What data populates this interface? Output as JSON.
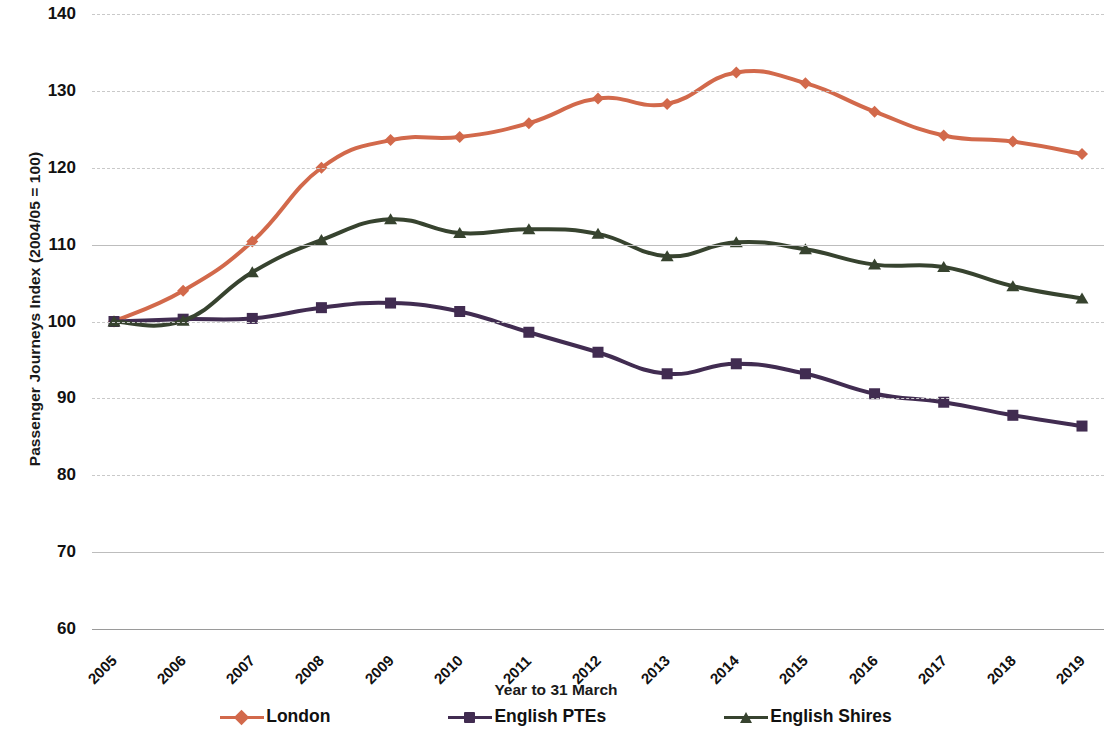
{
  "chart_data": {
    "type": "line",
    "title": "",
    "xlabel": "Year to 31 March",
    "ylabel": "Passenger Journeys Index (2004/05 = 100)",
    "categories": [
      "2005",
      "2006",
      "2007",
      "2008",
      "2009",
      "2010",
      "2011",
      "2012",
      "2013",
      "2014",
      "2015",
      "2016",
      "2017",
      "2018",
      "2019"
    ],
    "ylim": [
      60,
      140
    ],
    "yticks": [
      60,
      70,
      80,
      90,
      100,
      110,
      120,
      130,
      140
    ],
    "grid": true,
    "legend_position": "bottom",
    "series": [
      {
        "name": "London",
        "color": "#D2694B",
        "marker": "diamond",
        "values": [
          100,
          104,
          110.4,
          120,
          123.6,
          124,
          125.8,
          129,
          128.3,
          132.4,
          131,
          127.3,
          124.2,
          123.4,
          121.8
        ]
      },
      {
        "name": "English PTEs",
        "color": "#412C51",
        "marker": "square",
        "values": [
          100,
          100.3,
          100.4,
          101.8,
          102.4,
          101.3,
          98.6,
          96,
          93.2,
          94.5,
          93.2,
          90.6,
          89.5,
          87.8,
          86.4
        ]
      },
      {
        "name": "English Shires",
        "color": "#37432F",
        "marker": "triangle",
        "values": [
          100,
          100.1,
          106.4,
          110.6,
          113.3,
          111.5,
          112,
          111.4,
          108.5,
          110.3,
          109.4,
          107.4,
          107.1,
          104.6,
          103
        ]
      }
    ]
  }
}
